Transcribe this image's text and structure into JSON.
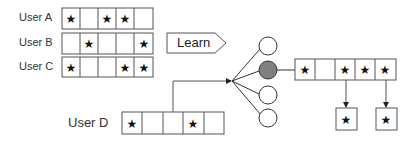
{
  "diagram": {
    "training_users": [
      {
        "label": "User A",
        "cells": [
          true,
          false,
          true,
          true,
          false
        ]
      },
      {
        "label": "User B",
        "cells": [
          false,
          true,
          false,
          false,
          true
        ]
      },
      {
        "label": "User C",
        "cells": [
          true,
          false,
          false,
          true,
          true
        ]
      }
    ],
    "learn_label": "Learn",
    "query_user": {
      "label": "User D",
      "cells": [
        true,
        false,
        false,
        true,
        false
      ]
    },
    "network": {
      "node_count": 4,
      "active_node_index": 1,
      "active_color": "#808080"
    },
    "output_cells": [
      true,
      false,
      true,
      true,
      true
    ],
    "predicted_cells": [
      2,
      4
    ],
    "star_glyph": "★"
  }
}
